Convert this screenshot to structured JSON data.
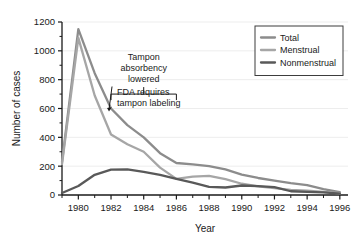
{
  "chart_data": {
    "type": "line",
    "title": "",
    "xlabel": "Year",
    "ylabel": "Number of cases",
    "xlim": [
      1979,
      1996.5
    ],
    "ylim": [
      0,
      1200
    ],
    "grid": true,
    "grid_orientation": "horizontal",
    "legend_position": "top-right",
    "x_tick_labels": [
      "1980",
      "1982",
      "1984",
      "1986",
      "1988",
      "1990",
      "1992",
      "1994",
      "1996"
    ],
    "x_tick_values": [
      1980,
      1982,
      1984,
      1986,
      1988,
      1990,
      1992,
      1994,
      1996
    ],
    "x_minor_ticks": [
      1979,
      1981,
      1983,
      1985,
      1987,
      1989,
      1991,
      1993,
      1995
    ],
    "y_tick_labels": [
      "0",
      "200",
      "400",
      "600",
      "800",
      "1000",
      "1200"
    ],
    "y_tick_values": [
      0,
      200,
      400,
      600,
      800,
      1000,
      1200
    ],
    "y_minor_ticks": [
      100,
      300,
      500,
      700,
      900,
      1100
    ],
    "x": [
      1979,
      1980,
      1981,
      1982,
      1983,
      1984,
      1985,
      1986,
      1987,
      1988,
      1989,
      1990,
      1991,
      1992,
      1993,
      1994,
      1995,
      1996
    ],
    "series": [
      {
        "name": "Total",
        "color": "#8c8c8c",
        "values": [
          228,
          1150,
          845,
          600,
          485,
          400,
          290,
          222,
          212,
          200,
          178,
          142,
          118,
          100,
          82,
          68,
          40,
          20
        ]
      },
      {
        "name": "Menstrual",
        "color": "#a6a6a6",
        "values": [
          214,
          1090,
          690,
          420,
          352,
          300,
          190,
          112,
          128,
          132,
          110,
          78,
          60,
          48,
          35,
          30,
          22,
          12
        ]
      },
      {
        "name": "Nonmenstrual",
        "color": "#595959",
        "values": [
          14,
          62,
          140,
          176,
          178,
          160,
          140,
          112,
          86,
          56,
          52,
          66,
          62,
          54,
          26,
          22,
          18,
          10
        ]
      }
    ],
    "annotations": [
      {
        "id": "tampon-absorbency-lowered",
        "lines": [
          "Tampon",
          "absorbency",
          "lowered"
        ],
        "bracket_start_year": 1982,
        "bracket_end_year": 1986,
        "bracket_value": 700
      },
      {
        "id": "fda-requires-tampon-labeling",
        "lines": [
          "FDA requires",
          "tampon labeling"
        ],
        "arrow_year": 1982,
        "arrow_value": 600
      }
    ]
  },
  "legend": {
    "items": [
      {
        "label": "Total",
        "color": "#8c8c8c"
      },
      {
        "label": "Menstrual",
        "color": "#a6a6a6"
      },
      {
        "label": "Nonmenstrual",
        "color": "#595959"
      }
    ]
  },
  "axes": {
    "x_title": "Year",
    "y_title": "Number of cases"
  }
}
